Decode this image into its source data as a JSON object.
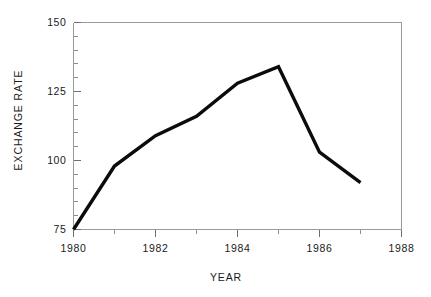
{
  "chart_data": {
    "type": "line",
    "title": "",
    "xlabel": "YEAR",
    "ylabel": "EXCHANGE RATE",
    "x": [
      1980,
      1981,
      1982,
      1983,
      1984,
      1985,
      1986,
      1987
    ],
    "values": [
      75,
      98,
      109,
      116,
      128,
      134,
      103,
      92
    ],
    "series": [
      {
        "name": "Exchange rate",
        "values": [
          75,
          98,
          109,
          116,
          128,
          134,
          103,
          92
        ],
        "color": "#0b0b0b"
      }
    ],
    "xlim": [
      1980,
      1988
    ],
    "ylim": [
      75,
      150
    ],
    "x_major_ticks": [
      1980,
      1982,
      1984,
      1986,
      1988
    ],
    "x_minor_ticks": [
      1981,
      1983,
      1985,
      1987
    ],
    "x_tick_labels": [
      "1980",
      "1982",
      "1984",
      "1986",
      "1988"
    ],
    "y_major_ticks": [
      75,
      100,
      125,
      150
    ],
    "y_minor_ticks": [
      80,
      85,
      90,
      95,
      105,
      110,
      115,
      120,
      130,
      135,
      140,
      145
    ],
    "y_tick_labels": [
      "75",
      "100",
      "125",
      "150"
    ],
    "grid": false,
    "legend": false,
    "legend_position": "none",
    "line_color": "#0b0b0b",
    "frame_color": "#9a9a9a",
    "background": "#ffffff"
  },
  "axes": {
    "x_title": "YEAR",
    "y_title": "EXCHANGE RATE"
  }
}
